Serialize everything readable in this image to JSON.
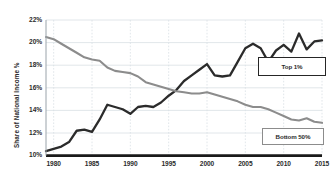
{
  "chart_data": {
    "type": "line",
    "title": "",
    "xlabel": "",
    "ylabel": "Share of National Income %",
    "xlim": [
      1979,
      2015
    ],
    "ylim": [
      10,
      22
    ],
    "yticks": [
      "10%",
      "12%",
      "14%",
      "16%",
      "18%",
      "20%",
      "22%"
    ],
    "ytick_values": [
      10,
      12,
      14,
      16,
      18,
      20,
      22
    ],
    "xticks": [
      "1980",
      "1985",
      "1990",
      "1995",
      "2000",
      "2005",
      "2010",
      "2015"
    ],
    "xtick_values": [
      1980,
      1985,
      1990,
      1995,
      2000,
      2005,
      2010,
      2015
    ],
    "grid": true,
    "legend_position": "inside-right",
    "x": [
      1979,
      1980,
      1981,
      1982,
      1983,
      1984,
      1985,
      1986,
      1987,
      1988,
      1989,
      1990,
      1991,
      1992,
      1993,
      1994,
      1995,
      1996,
      1997,
      1998,
      1999,
      2000,
      2001,
      2002,
      2003,
      2004,
      2005,
      2006,
      2007,
      2008,
      2009,
      2010,
      2011,
      2012,
      2013,
      2014,
      2015
    ],
    "series": [
      {
        "name": "Top 1%",
        "color": "#2b2b2b",
        "values": [
          10.4,
          10.6,
          10.8,
          11.2,
          12.2,
          12.3,
          12.1,
          13.2,
          14.5,
          14.3,
          14.1,
          13.7,
          14.3,
          14.4,
          14.3,
          14.7,
          15.3,
          15.8,
          16.6,
          17.1,
          17.6,
          18.1,
          17.1,
          17.0,
          17.1,
          18.3,
          19.5,
          19.9,
          19.5,
          18.3,
          19.3,
          19.8,
          19.2,
          20.8,
          19.4,
          20.1,
          20.2
        ]
      },
      {
        "name": "Bottom 50%",
        "color": "#8c8c8c",
        "values": [
          20.5,
          20.3,
          19.9,
          19.5,
          19.1,
          18.7,
          18.5,
          18.4,
          17.8,
          17.5,
          17.4,
          17.3,
          17.0,
          16.5,
          16.3,
          16.1,
          15.9,
          15.7,
          15.6,
          15.5,
          15.5,
          15.6,
          15.4,
          15.2,
          15.0,
          14.8,
          14.5,
          14.3,
          14.3,
          14.1,
          13.8,
          13.5,
          13.2,
          13.1,
          13.3,
          13.0,
          12.9
        ]
      }
    ],
    "legend_labels": {
      "top": "Top 1%",
      "bottom": "Bottom 50%"
    }
  },
  "colors": {
    "top1_line": "#2b2b2b",
    "bottom50_line": "#8c8c8c",
    "grid": "#d9dfe4",
    "axis": "#1a1a1a",
    "background": "#ffffff"
  }
}
